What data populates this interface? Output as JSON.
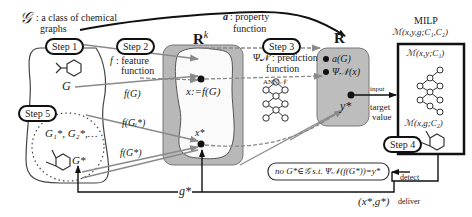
{
  "title_class": {
    "symbol": "𝒢",
    "text": ": a class of chemical",
    "text2": "graphs"
  },
  "property": {
    "symbol": "a",
    "text": ": property",
    "text2": "function"
  },
  "steps": [
    "Step 1",
    "Step 2",
    "Step 3",
    "Step 4",
    "Step 5"
  ],
  "feature": {
    "symbol": "f",
    "text": ": feature",
    "text2": "function"
  },
  "graph_G": "G",
  "f_G": "f(G)",
  "f_Gi": "f(Gᵢ*)",
  "f_Gstar": "f(G*)",
  "gstar_list": "G₁*, G₂*,…",
  "Gstar": "G*",
  "space_Rk": {
    "base": "R",
    "sup": "k"
  },
  "x_def": "x:=f(G)",
  "x_star": "x*",
  "predict": {
    "symbol": "Ψ𝒩",
    "text": ": prediction",
    "text2": "function"
  },
  "ann": "ANN 𝒩",
  "space_R": "R",
  "r_items": {
    "aG": "a(G)",
    "psi": "Ψ𝒩(x)",
    "ystar": "y*"
  },
  "target": {
    "l1": "target",
    "l2": "value"
  },
  "input_label": "input",
  "milp": {
    "title": "MILP",
    "model": "ℳ(x,y,g;C₁,C₂)",
    "m1": "ℳ(x,y;C₁)",
    "m2": "ℳ(x,g;C₂)"
  },
  "no_solution": "no G*∈𝒢 s.t. Ψ𝒩(f(G*))=y*",
  "detect": "detect",
  "deliver": "deliver",
  "deliver_pair": "(x*,g*)",
  "g_star": "g*",
  "colors": {
    "gray_box": "#b8b8b8",
    "gray_arrow": "#8a8a8a",
    "line": "#111111"
  }
}
